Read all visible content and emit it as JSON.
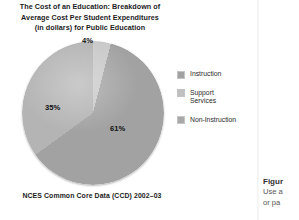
{
  "chart_data": {
    "type": "pie",
    "title": "The Cost of an Education: Breakdown of Average Cost Per Student Expenditures (in dollars) for Public Education",
    "title_lines": [
      "The Cost of an Education: Breakdown of",
      "Average Cost Per Student Expenditures",
      "(in dollars) for Public Education"
    ],
    "categories": [
      "Instruction",
      "Support Services",
      "Non-Instruction"
    ],
    "values": [
      61,
      35,
      4
    ],
    "value_labels": [
      "61%",
      "35%",
      "4%"
    ],
    "unit": "percent",
    "legend_position": "right",
    "grid": false,
    "source": "NCES Common Core Data (CCD) 2002–03",
    "slice_colors": [
      "#a2a2a2",
      "#b4b4b4",
      "#c9c9c9"
    ]
  },
  "legend": {
    "items": [
      {
        "label": "Instruction",
        "color": "#a2a2a2"
      },
      {
        "label": "Support\nServices",
        "color": "#b4b4b4"
      },
      {
        "label": "Non-Instruction",
        "color": "#a9a9a9"
      }
    ]
  },
  "caption": {
    "title": "Figur",
    "lines": [
      "Use a",
      "or pa"
    ]
  }
}
